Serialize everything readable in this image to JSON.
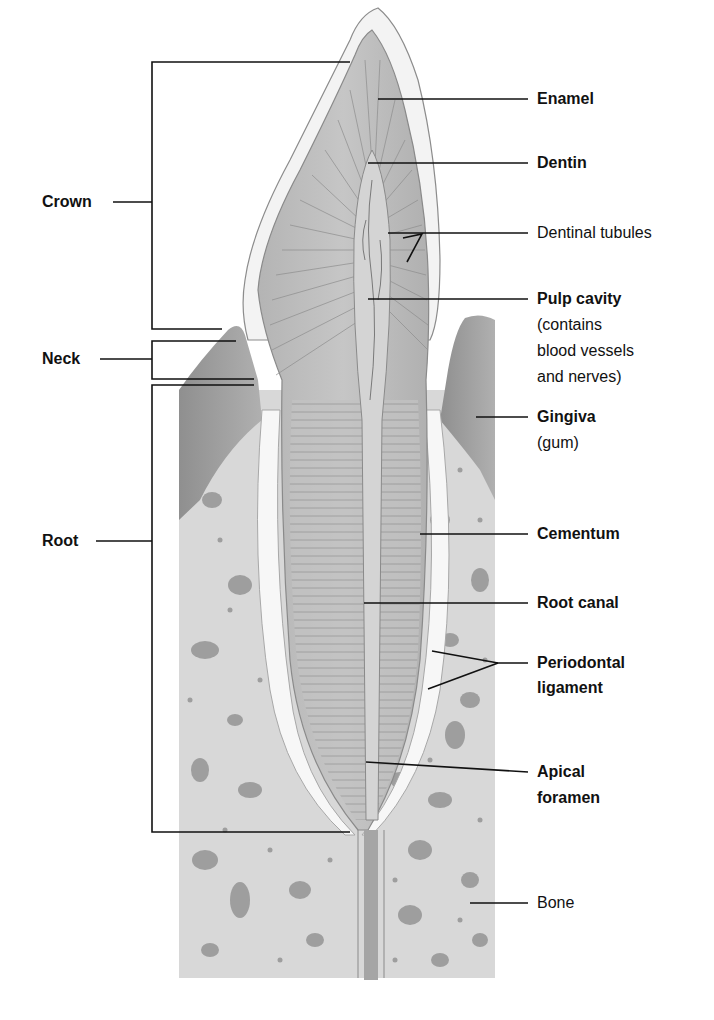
{
  "regions": [
    {
      "id": "crown",
      "label": "Crown"
    },
    {
      "id": "neck",
      "label": "Neck"
    },
    {
      "id": "root",
      "label": "Root"
    }
  ],
  "labels": {
    "enamel": {
      "title": "Enamel"
    },
    "dentin": {
      "title": "Dentin"
    },
    "dentinal_tubules": {
      "title": "Dentinal tubules"
    },
    "pulp_cavity": {
      "title": "Pulp cavity",
      "note_lines": [
        "(contains",
        "blood vessels",
        "and nerves)"
      ]
    },
    "gingiva": {
      "title": "Gingiva",
      "note": "(gum)"
    },
    "cementum": {
      "title": "Cementum"
    },
    "root_canal": {
      "title": "Root canal"
    },
    "periodontal_ligament": {
      "title_lines": [
        "Periodontal",
        "ligament"
      ]
    },
    "apical_foramen": {
      "title_lines": [
        "Apical",
        "foramen"
      ]
    },
    "bone": {
      "title": "Bone"
    }
  },
  "colors": {
    "enamel": "#f4f4f4",
    "dentin": "#bdbdbd",
    "pulp": "#d2d2d2",
    "gingiva": "#9a9a9a",
    "bone": "#d9d9d9",
    "bone_spots": "#9d9d9d",
    "ligament": "#f8f8f8",
    "leader": "#111111"
  }
}
